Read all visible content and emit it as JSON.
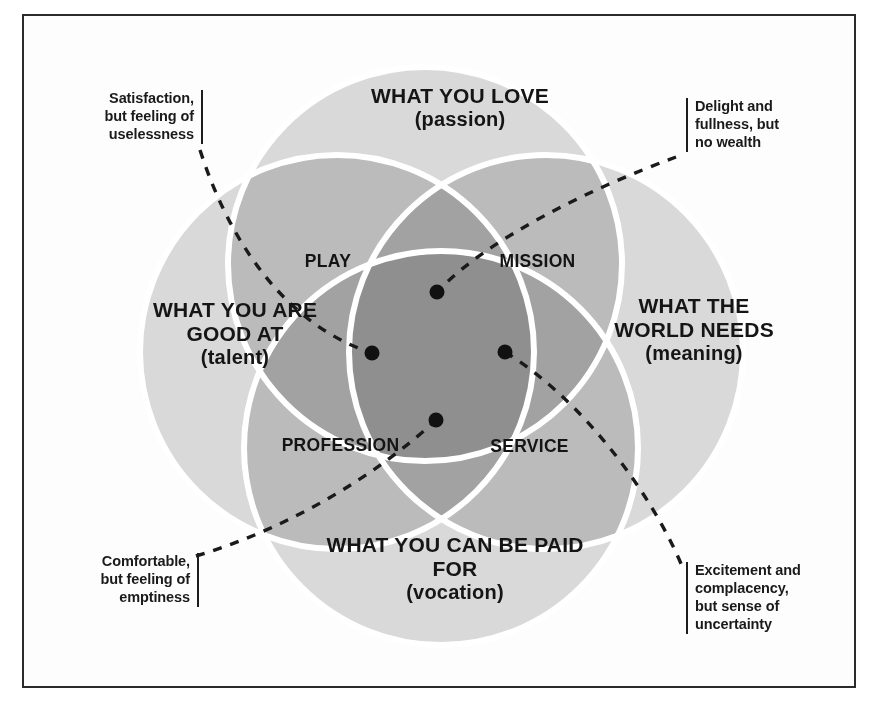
{
  "diagram": {
    "frame_color": "#2b2b2b",
    "background": "#ffffff",
    "circle_fill": "#bdbdbd",
    "circle_stroke": "#ffffff",
    "dot_color": "#111111",
    "dash_color": "#1a1a1a"
  },
  "circles": [
    {
      "id": "love",
      "label_main": "WHAT YOU\nLOVE",
      "label_sub": "(passion)",
      "cx": 425,
      "cy": 264,
      "r": 197
    },
    {
      "id": "talent",
      "label_main": "WHAT\nYOU ARE\nGOOD AT",
      "label_sub": "(talent)",
      "cx": 337,
      "cy": 352,
      "r": 197
    },
    {
      "id": "world",
      "label_main": "WHAT THE\nWORLD\nNEEDS",
      "label_sub": "(meaning)",
      "cx": 546,
      "cy": 352,
      "r": 197
    },
    {
      "id": "paid",
      "label_main": "WHAT YOU CAN\nBE PAID FOR",
      "label_sub": "(vocation)",
      "cx": 441,
      "cy": 448,
      "r": 197
    }
  ],
  "intersections": [
    {
      "id": "play",
      "label": "PLAY"
    },
    {
      "id": "mission",
      "label": "MISSION"
    },
    {
      "id": "profession",
      "label": "PROFESSION"
    },
    {
      "id": "service",
      "label": "SERVICE"
    }
  ],
  "callouts": [
    {
      "id": "top-left",
      "text": "Satisfaction,\nbut feeling of\nuselessness",
      "align": "right"
    },
    {
      "id": "top-right",
      "text": "Delight and\nfullness, but\nno wealth",
      "align": "left"
    },
    {
      "id": "bottom-left",
      "text": "Comfortable,\nbut feeling of\nemptiness",
      "align": "right"
    },
    {
      "id": "bottom-right",
      "text": "Excitement and\ncomplacency,\nbut sense of\nuncertainty",
      "align": "left"
    }
  ],
  "dots": [
    {
      "id": "dot-top",
      "cx": 437,
      "cy": 292,
      "r": 7
    },
    {
      "id": "dot-left",
      "cx": 372,
      "cy": 353,
      "r": 7
    },
    {
      "id": "dot-right",
      "cx": 505,
      "cy": 352,
      "r": 7
    },
    {
      "id": "dot-bottom",
      "cx": 436,
      "cy": 420,
      "r": 7
    }
  ]
}
